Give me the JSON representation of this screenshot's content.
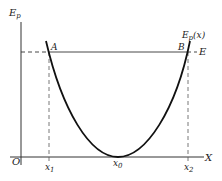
{
  "diagram": {
    "y_axis_label": "E",
    "y_axis_label_sub": "p",
    "x_axis_label": "X",
    "origin_label": "O",
    "curve_label": "E",
    "curve_label_sub": "p",
    "curve_label_arg": "(x)",
    "energy_line_label": "E",
    "point_a_label": "A",
    "point_b_label": "B",
    "x1_label": "x",
    "x1_sub": "1",
    "x0_label": "x",
    "x0_sub": "0",
    "x2_label": "x",
    "x2_sub": "2",
    "colors": {
      "line": "#222222",
      "background": "#ffffff"
    }
  }
}
